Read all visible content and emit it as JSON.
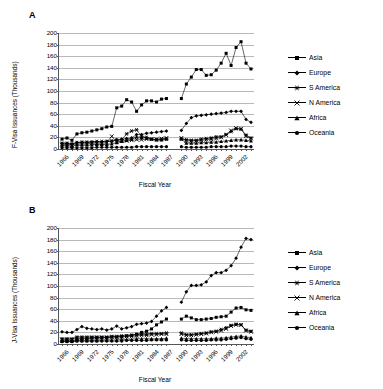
{
  "figure": {
    "panels": [
      {
        "letter": "A",
        "ylabel": "F-Visa Issuances (Thousands)",
        "xlabel": "Fiscal Year"
      },
      {
        "letter": "B",
        "ylabel": "J-Visa Issuances (Thousands)",
        "xlabel": "Fiscal Year"
      }
    ],
    "legend": [
      {
        "label": "Asia",
        "marker": "square"
      },
      {
        "label": "Europe",
        "marker": "diamond"
      },
      {
        "label": "S America",
        "marker": "star"
      },
      {
        "label": "N America",
        "marker": "cross"
      },
      {
        "label": "Africa",
        "marker": "triangle"
      },
      {
        "label": "Oceania",
        "marker": "circle"
      }
    ]
  },
  "chart_data": [
    {
      "type": "line",
      "panel": "A",
      "title": "",
      "xlabel": "Fiscal Year",
      "ylabel": "F-Visa Issuances (Thousands)",
      "ylim": [
        0,
        200
      ],
      "yticks": [
        0,
        20,
        40,
        60,
        80,
        100,
        120,
        140,
        160,
        180,
        200
      ],
      "grid": true,
      "legend_position": "right",
      "x": [
        1966,
        1967,
        1968,
        1969,
        1970,
        1971,
        1972,
        1973,
        1974,
        1975,
        1976,
        1977,
        1978,
        1979,
        1980,
        1981,
        1982,
        1983,
        1984,
        1985,
        1986,
        1987,
        1990,
        1991,
        1992,
        1993,
        1994,
        1995,
        1996,
        1997,
        1998,
        1999,
        2000,
        2001,
        2002,
        2003,
        2004
      ],
      "tick_labels": [
        "1966",
        "1969",
        "1972",
        "1975",
        "1978",
        "1981",
        "1984",
        "1987",
        "1990",
        "1993",
        "1996",
        "1999",
        "2002"
      ],
      "series": [
        {
          "name": "Asia",
          "marker": "square",
          "values": [
            17,
            19,
            15,
            26,
            28,
            29,
            31,
            33,
            35,
            38,
            39,
            71,
            74,
            85,
            81,
            65,
            76,
            83,
            83,
            81,
            86,
            87,
            87,
            112,
            124,
            137,
            137,
            127,
            128,
            136,
            148,
            165,
            144,
            175,
            185,
            148,
            138
          ]
        },
        {
          "name": "Europe",
          "marker": "diamond",
          "values": [
            9,
            9,
            8,
            11,
            11,
            11,
            12,
            12,
            12,
            13,
            13,
            16,
            17,
            18,
            19,
            25,
            25,
            27,
            28,
            29,
            30,
            31,
            32,
            44,
            54,
            57,
            58,
            59,
            60,
            61,
            62,
            63,
            65,
            65,
            65,
            51,
            46
          ]
        },
        {
          "name": "S America",
          "marker": "star",
          "values": [
            10,
            10,
            9,
            11,
            12,
            12,
            12,
            13,
            13,
            13,
            14,
            15,
            16,
            26,
            31,
            33,
            22,
            20,
            17,
            16,
            17,
            18,
            18,
            16,
            15,
            15,
            17,
            18,
            19,
            21,
            21,
            25,
            30,
            35,
            34,
            24,
            19
          ]
        },
        {
          "name": "N America",
          "marker": "cross",
          "values": [
            8,
            8,
            7,
            9,
            9,
            9,
            10,
            10,
            10,
            11,
            22,
            12,
            14,
            14,
            15,
            16,
            16,
            17,
            17,
            17,
            18,
            19,
            19,
            14,
            14,
            14,
            15,
            16,
            17,
            18,
            20,
            24,
            32,
            36,
            35,
            22,
            18
          ]
        },
        {
          "name": "Africa",
          "marker": "triangle",
          "values": [
            6,
            6,
            5,
            7,
            7,
            7,
            7,
            8,
            8,
            8,
            9,
            11,
            13,
            15,
            17,
            21,
            20,
            19,
            17,
            16,
            16,
            17,
            17,
            10,
            10,
            10,
            11,
            11,
            12,
            12,
            13,
            14,
            15,
            16,
            16,
            15,
            14
          ]
        },
        {
          "name": "Oceania",
          "marker": "circle",
          "values": [
            2,
            2,
            2,
            2,
            2,
            2,
            2,
            3,
            3,
            3,
            3,
            3,
            3,
            3,
            3,
            4,
            4,
            4,
            4,
            4,
            4,
            4,
            4,
            3,
            3,
            3,
            3,
            3,
            4,
            4,
            4,
            4,
            5,
            5,
            5,
            4,
            4
          ]
        }
      ]
    },
    {
      "type": "line",
      "panel": "B",
      "title": "",
      "xlabel": "Fiscal Year",
      "ylabel": "J-Visa Issuances (Thousands)",
      "ylim": [
        0,
        200
      ],
      "yticks": [
        0,
        20,
        40,
        60,
        80,
        100,
        120,
        140,
        160,
        180,
        200
      ],
      "grid": true,
      "legend_position": "right",
      "x": [
        1966,
        1967,
        1968,
        1969,
        1970,
        1971,
        1972,
        1973,
        1974,
        1975,
        1976,
        1977,
        1978,
        1979,
        1980,
        1981,
        1982,
        1983,
        1984,
        1985,
        1986,
        1987,
        1990,
        1991,
        1992,
        1993,
        1994,
        1995,
        1996,
        1997,
        1998,
        1999,
        2000,
        2001,
        2002,
        2003,
        2004
      ],
      "tick_labels": [
        "1966",
        "1969",
        "1972",
        "1975",
        "1978",
        "1981",
        "1984",
        "1987",
        "1990",
        "1993",
        "1996",
        "1999",
        "2002"
      ],
      "series": [
        {
          "name": "Asia",
          "marker": "square",
          "values": [
            5,
            6,
            5,
            8,
            9,
            9,
            10,
            10,
            11,
            11,
            12,
            12,
            13,
            14,
            15,
            17,
            20,
            22,
            26,
            33,
            38,
            43,
            43,
            48,
            45,
            42,
            42,
            43,
            44,
            46,
            47,
            48,
            55,
            62,
            63,
            59,
            58
          ]
        },
        {
          "name": "Europe",
          "marker": "diamond",
          "values": [
            21,
            20,
            20,
            25,
            30,
            27,
            26,
            25,
            26,
            24,
            26,
            31,
            26,
            28,
            30,
            34,
            35,
            36,
            39,
            48,
            57,
            63,
            72,
            90,
            101,
            101,
            102,
            107,
            118,
            123,
            123,
            127,
            135,
            148,
            167,
            182,
            180
          ]
        },
        {
          "name": "S America",
          "marker": "star",
          "values": [
            9,
            9,
            9,
            12,
            12,
            12,
            12,
            12,
            12,
            12,
            13,
            13,
            14,
            14,
            15,
            16,
            17,
            17,
            18,
            18,
            18,
            19,
            19,
            16,
            16,
            17,
            18,
            19,
            21,
            22,
            25,
            28,
            32,
            34,
            33,
            24,
            22
          ]
        },
        {
          "name": "N America",
          "marker": "cross",
          "values": [
            8,
            8,
            8,
            10,
            10,
            10,
            11,
            11,
            11,
            11,
            12,
            12,
            12,
            13,
            13,
            14,
            15,
            15,
            16,
            16,
            17,
            17,
            17,
            15,
            15,
            16,
            17,
            18,
            20,
            21,
            23,
            26,
            31,
            33,
            33,
            23,
            21
          ]
        },
        {
          "name": "Africa",
          "marker": "triangle",
          "values": [
            5,
            5,
            5,
            6,
            6,
            6,
            6,
            6,
            7,
            7,
            7,
            7,
            8,
            8,
            8,
            9,
            9,
            9,
            9,
            9,
            9,
            10,
            10,
            9,
            9,
            9,
            9,
            9,
            9,
            10,
            10,
            11,
            12,
            13,
            14,
            12,
            11
          ]
        },
        {
          "name": "Oceania",
          "marker": "circle",
          "values": [
            4,
            4,
            4,
            5,
            5,
            5,
            5,
            5,
            5,
            5,
            5,
            5,
            5,
            6,
            6,
            6,
            6,
            6,
            7,
            7,
            7,
            7,
            7,
            6,
            6,
            6,
            6,
            6,
            7,
            7,
            7,
            8,
            9,
            10,
            11,
            9,
            8
          ]
        }
      ]
    }
  ]
}
